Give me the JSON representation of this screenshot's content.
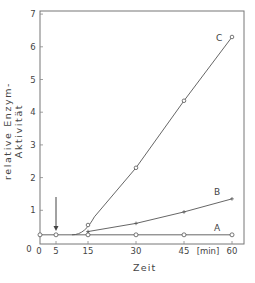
{
  "chart_data": {
    "type": "line",
    "title": "",
    "xlabel": "Zeit",
    "xunit": "[min]",
    "ylabel": "relative Enzym-Aktivität",
    "xlim": [
      0,
      65
    ],
    "ylim": [
      0,
      7.1
    ],
    "xticks": [
      0,
      5,
      15,
      30,
      45,
      60
    ],
    "yticks": [
      0,
      1,
      2,
      3,
      4,
      5,
      6,
      7
    ],
    "grid": false,
    "legend": "inline labels",
    "annotations": [
      {
        "type": "arrow",
        "x": 5,
        "label": "",
        "direction": "down"
      }
    ],
    "series": [
      {
        "name": "A",
        "marker": "circle",
        "x": [
          0,
          5,
          15,
          30,
          45,
          60
        ],
        "values": [
          0.25,
          0.25,
          0.25,
          0.25,
          0.25,
          0.25
        ]
      },
      {
        "name": "B",
        "marker": "plus",
        "x": [
          0,
          5,
          15,
          30,
          45,
          60
        ],
        "values": [
          0.25,
          0.25,
          0.35,
          0.6,
          0.95,
          1.35
        ]
      },
      {
        "name": "C",
        "marker": "circle",
        "x": [
          0,
          5,
          15,
          30,
          45,
          60
        ],
        "values": [
          0.25,
          0.25,
          0.55,
          2.3,
          4.35,
          6.3
        ]
      }
    ]
  },
  "labels": {
    "ylabel": "relative Enzym- Aktivität",
    "xlabel": "Zeit",
    "xunit": "[min]"
  },
  "colors": {
    "line": "#555555",
    "text": "#444444"
  }
}
